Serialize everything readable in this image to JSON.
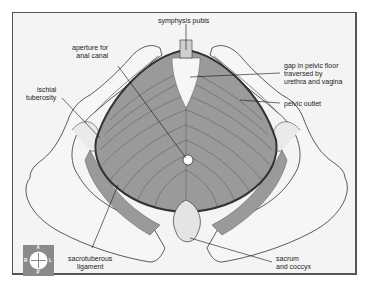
{
  "diagram": {
    "labels": {
      "symphysis_pubis": "symphysis pubis",
      "aperture_anal": [
        "aperture for",
        "anal canal"
      ],
      "ischial_tuberosity": [
        "ischial",
        "tuberosity"
      ],
      "gap_pelvic_floor": [
        "gap in pelvic floor",
        "traversed by",
        "urethra and vagina"
      ],
      "pelvic_outlet": "pelvic  outlet",
      "sacrotuberous_ligament": [
        "sacrotuberous",
        "ligament"
      ],
      "sacrum_coccyx": [
        "sacrum",
        "and coccyx"
      ]
    },
    "compass": {
      "anterior": "A",
      "posterior": "P",
      "right": "R",
      "left": "L"
    },
    "colors": {
      "background": "#f4f4f4",
      "frame": "#555555",
      "muscle": "#9a9a9a",
      "muscle_lines": "#5a5a5a",
      "bone": "#f2f2f2",
      "outline": "#333333",
      "compass_bg": "#8a8a8a"
    }
  }
}
